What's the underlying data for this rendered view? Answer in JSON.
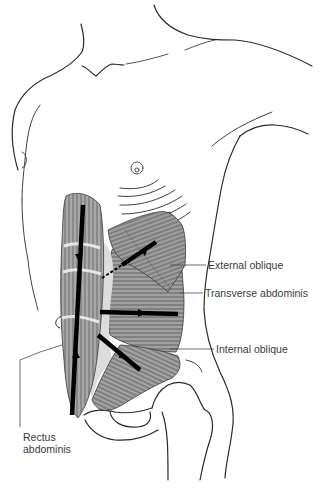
{
  "figure": {
    "colors": {
      "outline": "#2a2a2a",
      "muscle_fill": "#9a9a9a",
      "muscle_light": "#d8d8d8",
      "arrow": "#000000",
      "label_text": "#3a3a3a",
      "leader_line": "#4a4a4a"
    }
  },
  "labels": [
    {
      "id": "external-oblique",
      "text": "External oblique"
    },
    {
      "id": "transverse-abdominis",
      "text": "Transverse abdominis"
    },
    {
      "id": "internal-oblique",
      "text": "Internal oblique"
    },
    {
      "id": "rectus-abdominis-line1",
      "text": "Rectus"
    },
    {
      "id": "rectus-abdominis-line2",
      "text": "abdominis"
    }
  ]
}
